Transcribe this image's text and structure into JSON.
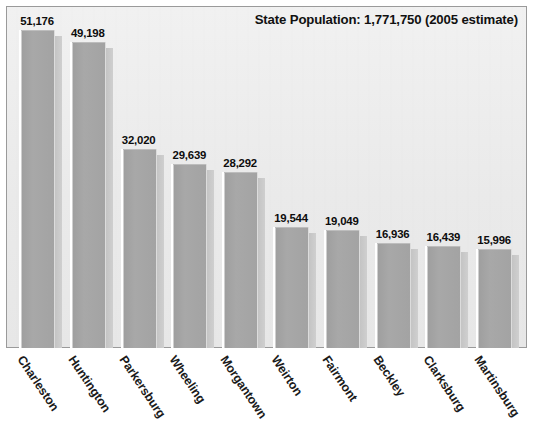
{
  "chart_data": {
    "type": "bar",
    "title": "State Population: 1,771,750 (2005 estimate)",
    "xlabel": "",
    "ylabel": "",
    "grid": false,
    "legend": "none",
    "ylim": [
      0,
      55000
    ],
    "categories": [
      "Charleston",
      "Huntington",
      "Parkersburg",
      "Wheeling",
      "Morgantown",
      "Weirton",
      "Fairmont",
      "Beckley",
      "Clarksburg",
      "Martinsburg"
    ],
    "values": [
      51176,
      49198,
      32020,
      29639,
      28292,
      19544,
      19049,
      16936,
      16439,
      15996
    ],
    "value_labels": [
      "51,176",
      "49,198",
      "32,020",
      "29,639",
      "28,292",
      "19,544",
      "19,049",
      "16,936",
      "16,439",
      "15,996"
    ],
    "colors": {
      "bar_fill": "#a6a6a6",
      "bar_shadow": "#c8c8c8",
      "plot_background": "#ededed",
      "plot_border": "#9a9a9a",
      "page_background": "#ffffff",
      "text": "#111111"
    }
  }
}
